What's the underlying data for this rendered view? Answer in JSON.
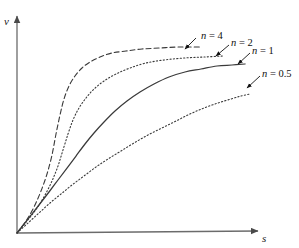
{
  "figure": {
    "background_color": "#ffffff",
    "line_color": "#3a3a3a",
    "axis_color": "#6b6b6b",
    "text_color": "#111111",
    "width": 299,
    "height": 248
  },
  "axes": {
    "x_label": "s",
    "y_label": "v",
    "x_arrow_icon": "arrow-right-icon",
    "y_arrow_icon": "arrow-up-icon",
    "grid": false,
    "ticks": []
  },
  "chart_data": {
    "type": "line",
    "title": "",
    "subtitle": "",
    "xlabel": "s",
    "ylabel": "v",
    "xlim": [
      0,
      1
    ],
    "ylim": [
      0,
      1
    ],
    "grid": false,
    "legend_position": "inline-annotations",
    "annotations": [
      {
        "text": "n = 4",
        "label_x": 201,
        "label_y": 31,
        "arrow_from_x": 196,
        "arrow_from_y": 38,
        "arrow_to_x": 185,
        "arrow_to_y": 49
      },
      {
        "text": "n = 2",
        "label_x": 231,
        "label_y": 38,
        "arrow_from_x": 229,
        "arrow_from_y": 45,
        "arrow_to_x": 216,
        "arrow_to_y": 56
      },
      {
        "text": "n = 1",
        "label_x": 252,
        "label_y": 46,
        "arrow_from_x": 250,
        "arrow_from_y": 53,
        "arrow_to_x": 238,
        "arrow_to_y": 64
      },
      {
        "text": "n = 0.5",
        "label_x": 262,
        "label_y": 69,
        "arrow_from_x": 260,
        "arrow_from_y": 76,
        "arrow_to_x": 247,
        "arrow_to_y": 88
      }
    ],
    "series": [
      {
        "name": "n = 4",
        "n": 4,
        "line_style": "dashed",
        "points_px": [
          [
            17,
            233
          ],
          [
            26,
            221
          ],
          [
            34,
            207
          ],
          [
            41,
            191
          ],
          [
            47,
            174
          ],
          [
            52,
            155
          ],
          [
            56,
            134
          ],
          [
            60,
            115
          ],
          [
            64,
            99
          ],
          [
            69,
            86
          ],
          [
            75,
            76
          ],
          [
            82,
            68
          ],
          [
            90,
            62
          ],
          [
            100,
            57
          ],
          [
            112,
            53
          ],
          [
            126,
            51
          ],
          [
            142,
            49
          ],
          [
            160,
            48
          ],
          [
            178,
            47
          ],
          [
            200,
            47
          ]
        ]
      },
      {
        "name": "n = 2",
        "n": 2,
        "line_style": "dotted",
        "points_px": [
          [
            17,
            233
          ],
          [
            27,
            221
          ],
          [
            37,
            208
          ],
          [
            45,
            195
          ],
          [
            52,
            181
          ],
          [
            58,
            166
          ],
          [
            63,
            150
          ],
          [
            68,
            134
          ],
          [
            73,
            120
          ],
          [
            79,
            108
          ],
          [
            86,
            98
          ],
          [
            94,
            89
          ],
          [
            104,
            81
          ],
          [
            116,
            74
          ],
          [
            130,
            68
          ],
          [
            146,
            63
          ],
          [
            164,
            60
          ],
          [
            184,
            58
          ],
          [
            204,
            57
          ],
          [
            223,
            56
          ]
        ]
      },
      {
        "name": "n = 1",
        "n": 1,
        "line_style": "solid",
        "points_px": [
          [
            17,
            233
          ],
          [
            28,
            219
          ],
          [
            39,
            205
          ],
          [
            49,
            192
          ],
          [
            58,
            180
          ],
          [
            67,
            168
          ],
          [
            76,
            156
          ],
          [
            85,
            144
          ],
          [
            94,
            133
          ],
          [
            104,
            122
          ],
          [
            115,
            111
          ],
          [
            127,
            101
          ],
          [
            140,
            92
          ],
          [
            154,
            84
          ],
          [
            169,
            77
          ],
          [
            185,
            72
          ],
          [
            201,
            69
          ],
          [
            217,
            66
          ],
          [
            232,
            65
          ],
          [
            245,
            64
          ]
        ]
      },
      {
        "name": "n = 0.5",
        "n": 0.5,
        "line_style": "dotted",
        "points_px": [
          [
            17,
            233
          ],
          [
            28,
            223
          ],
          [
            39,
            213
          ],
          [
            50,
            203
          ],
          [
            61,
            194
          ],
          [
            72,
            185
          ],
          [
            84,
            176
          ],
          [
            96,
            167
          ],
          [
            108,
            159
          ],
          [
            121,
            151
          ],
          [
            134,
            143
          ],
          [
            148,
            135
          ],
          [
            162,
            128
          ],
          [
            176,
            121
          ],
          [
            190,
            114
          ],
          [
            204,
            108
          ],
          [
            218,
            103
          ],
          [
            231,
            99
          ],
          [
            241,
            96
          ],
          [
            250,
            94
          ]
        ]
      }
    ],
    "shared_crossing_point_px": [
      57,
      187
    ],
    "origin_px": [
      17,
      233
    ]
  }
}
